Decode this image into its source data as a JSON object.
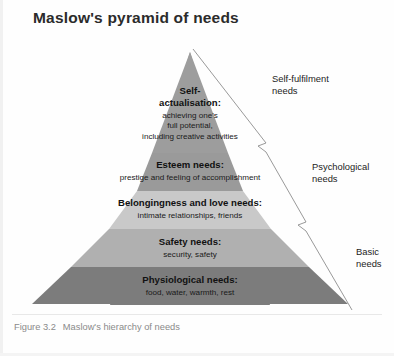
{
  "title": "Maslow's pyramid of needs",
  "caption": {
    "number": "Figure 3.2",
    "text": "Maslow's hierarchy of needs"
  },
  "colors": {
    "tier1": "#9d9d9d",
    "tier2": "#9a9a9a",
    "tier3": "#c9c9c9",
    "tier4": "#b0b0b0",
    "tier5": "#7c7c7c",
    "bracket_stroke": "#8d8d8d",
    "title_text": "#2b2b2b",
    "caption_text": "#8a8a8a"
  },
  "pyramid": {
    "tiers": [
      {
        "id": "self-actualisation",
        "title_line1": "Self-",
        "title_line2": "actualisation:",
        "sub_line1": "achieving one's",
        "sub_line2": "full potential,",
        "sub_line3": "including creative activities"
      },
      {
        "id": "esteem",
        "title_line1": "Esteem needs:",
        "sub_line1": "prestige and feeling of accomplishment"
      },
      {
        "id": "belongingness",
        "title_line1": "Belongingness and love needs:",
        "sub_line1": "intimate relationships, friends"
      },
      {
        "id": "safety",
        "title_line1": "Safety needs:",
        "sub_line1": "security, safety"
      },
      {
        "id": "physiological",
        "title_line1": "Physiological needs:",
        "sub_line1": "food, water, warmth, rest"
      }
    ]
  },
  "brackets": [
    {
      "id": "self-fulfilment",
      "line1": "Self-fulfilment",
      "line2": "needs"
    },
    {
      "id": "psychological",
      "line1": "Psychological",
      "line2": "needs"
    },
    {
      "id": "basic",
      "line1": "Basic",
      "line2": "needs"
    }
  ]
}
